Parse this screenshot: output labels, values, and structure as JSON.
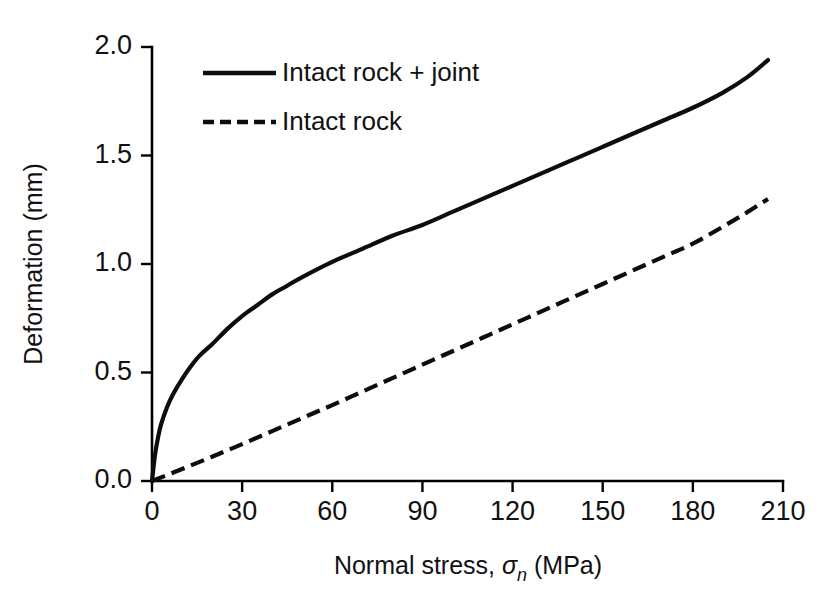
{
  "chart_data": {
    "type": "line",
    "title": "",
    "xlabel": "Normal stress, σn (MPa)",
    "xlabel_parts": {
      "prefix": "Normal stress, ",
      "symbol": "σ",
      "subscript": "n",
      "suffix": " (MPa)"
    },
    "ylabel": "Deformation (mm)",
    "xlim": [
      0,
      210
    ],
    "ylim": [
      0.0,
      2.0
    ],
    "xticks": [
      0,
      30,
      60,
      90,
      120,
      150,
      180,
      210
    ],
    "xtick_labels": [
      "0",
      "30",
      "60",
      "90",
      "120",
      "150",
      "180",
      "210"
    ],
    "yticks": [
      0.0,
      0.5,
      1.0,
      1.5,
      2.0
    ],
    "ytick_labels": [
      "0.0",
      "0.5",
      "1.0",
      "1.5",
      "2.0"
    ],
    "grid": false,
    "legend_position": "upper-left-inside",
    "line_color": "#0d0d0d",
    "background_color": "#ffffff",
    "series": [
      {
        "name": "Intact rock + joint",
        "style": "solid",
        "x": [
          0,
          1,
          2,
          3,
          5,
          7,
          10,
          13,
          16,
          20,
          25,
          30,
          35,
          40,
          45,
          50,
          60,
          70,
          80,
          90,
          100,
          110,
          120,
          130,
          140,
          150,
          160,
          170,
          180,
          190,
          198,
          205
        ],
        "y": [
          0.0,
          0.12,
          0.2,
          0.26,
          0.34,
          0.4,
          0.47,
          0.53,
          0.58,
          0.63,
          0.7,
          0.76,
          0.81,
          0.86,
          0.9,
          0.94,
          1.01,
          1.07,
          1.13,
          1.18,
          1.24,
          1.3,
          1.36,
          1.42,
          1.48,
          1.54,
          1.6,
          1.66,
          1.72,
          1.79,
          1.86,
          1.94
        ]
      },
      {
        "name": "Intact rock",
        "style": "dashed",
        "x": [
          0,
          10,
          20,
          30,
          40,
          50,
          60,
          70,
          80,
          90,
          100,
          110,
          120,
          130,
          140,
          150,
          160,
          170,
          180,
          190,
          198,
          205
        ],
        "y": [
          0.0,
          0.055,
          0.112,
          0.17,
          0.23,
          0.29,
          0.35,
          0.412,
          0.474,
          0.536,
          0.598,
          0.66,
          0.722,
          0.784,
          0.846,
          0.908,
          0.97,
          1.032,
          1.094,
          1.172,
          1.238,
          1.3
        ]
      }
    ]
  },
  "legend": {
    "entries": [
      {
        "label": "Intact rock + joint",
        "style": "solid"
      },
      {
        "label": "Intact rock",
        "style": "dashed"
      }
    ]
  }
}
